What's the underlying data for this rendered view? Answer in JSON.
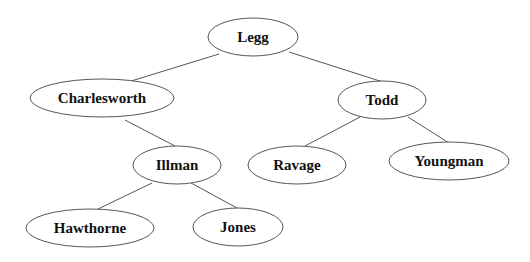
{
  "diagram": {
    "type": "binary-tree",
    "nodes": [
      {
        "id": "legg",
        "label": "Legg",
        "cx": 253,
        "cy": 37,
        "rx": 45,
        "ry": 19
      },
      {
        "id": "charlesworth",
        "label": "Charlesworth",
        "cx": 102,
        "cy": 98,
        "rx": 72,
        "ry": 19
      },
      {
        "id": "todd",
        "label": "Todd",
        "cx": 382,
        "cy": 100,
        "rx": 44,
        "ry": 19
      },
      {
        "id": "illman",
        "label": "Illman",
        "cx": 177,
        "cy": 165,
        "rx": 44,
        "ry": 19
      },
      {
        "id": "ravage",
        "label": "Ravage",
        "cx": 297,
        "cy": 165,
        "rx": 49,
        "ry": 19
      },
      {
        "id": "youngman",
        "label": "Youngman",
        "cx": 449,
        "cy": 161,
        "rx": 60,
        "ry": 19
      },
      {
        "id": "hawthorne",
        "label": "Hawthorne",
        "cx": 90,
        "cy": 228,
        "rx": 64,
        "ry": 19
      },
      {
        "id": "jones",
        "label": "Jones",
        "cx": 238,
        "cy": 227,
        "rx": 45,
        "ry": 19
      }
    ],
    "edges": [
      {
        "from": "legg",
        "to": "charlesworth",
        "x1": 219,
        "y1": 54,
        "x2": 128,
        "y2": 82
      },
      {
        "from": "legg",
        "to": "todd",
        "x1": 289,
        "y1": 52,
        "x2": 383,
        "y2": 82
      },
      {
        "from": "charlesworth",
        "to": "illman",
        "x1": 125,
        "y1": 120,
        "x2": 175,
        "y2": 146
      },
      {
        "from": "todd",
        "to": "ravage",
        "x1": 360,
        "y1": 117,
        "x2": 305,
        "y2": 146
      },
      {
        "from": "todd",
        "to": "youngman",
        "x1": 408,
        "y1": 117,
        "x2": 449,
        "y2": 143
      },
      {
        "from": "illman",
        "to": "hawthorne",
        "x1": 152,
        "y1": 183,
        "x2": 98,
        "y2": 209
      },
      {
        "from": "illman",
        "to": "jones",
        "x1": 191,
        "y1": 183,
        "x2": 237,
        "y2": 208
      }
    ],
    "colors": {
      "background": "#ffffff",
      "stroke": "#555555",
      "text": "#111111"
    }
  }
}
